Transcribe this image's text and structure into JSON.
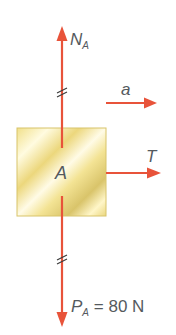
{
  "diagram": {
    "type": "free-body diagram",
    "body": {
      "label": "A",
      "fill_light": "#fff8c8",
      "fill_dark": "#e8d47a",
      "border": "#d8c46a"
    },
    "arrow_color": "#e8533a",
    "forces": [
      {
        "id": "normal",
        "symbol": "N",
        "subscript": "A",
        "direction": "up"
      },
      {
        "id": "tension",
        "symbol": "T",
        "direction": "right"
      },
      {
        "id": "weight",
        "symbol": "P",
        "subscript": "A",
        "equals": "=",
        "value": "80",
        "unit": "N",
        "direction": "down"
      }
    ],
    "acceleration": {
      "symbol": "a",
      "direction": "right"
    },
    "equal_magnitude_marks": "//"
  }
}
